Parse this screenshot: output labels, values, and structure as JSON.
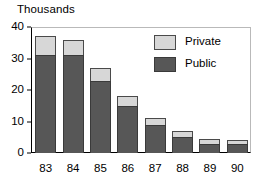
{
  "chart_data": {
    "type": "bar",
    "subtype": "stacked-vertical",
    "title": "Thousands",
    "xlabel": "",
    "ylabel": "",
    "categories": [
      "83",
      "84",
      "85",
      "86",
      "87",
      "88",
      "89",
      "90"
    ],
    "series": [
      {
        "name": "Public",
        "color": "#575757",
        "values": [
          31,
          31,
          23,
          15,
          9,
          5,
          3,
          3
        ]
      },
      {
        "name": "Private",
        "color": "#d7d7d7",
        "values": [
          6,
          5,
          4,
          3,
          2,
          2,
          1.5,
          1
        ]
      }
    ],
    "totals": [
      37,
      36,
      27,
      18,
      11,
      7,
      4.5,
      4
    ],
    "ylim": [
      0,
      40
    ],
    "yticks": [
      0,
      10,
      20,
      30,
      40
    ],
    "ytick_labels": [
      "0",
      "10",
      "20",
      "30",
      "40"
    ],
    "grid": false,
    "legend_position": "top-right",
    "legend_entries": [
      "Private",
      "Public"
    ]
  }
}
